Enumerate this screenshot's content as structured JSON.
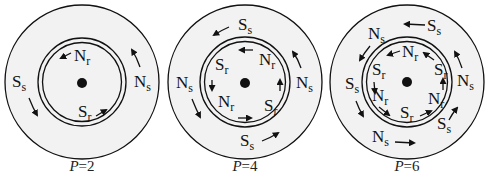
{
  "figure": {
    "background": "#ffffff",
    "ring_fill": "#f2f2f2",
    "stroke": "#111111",
    "diagrams": [
      {
        "id": "p2",
        "caption_var": "P",
        "caption_eq": "=2",
        "stator_labels": [
          {
            "main": "S",
            "sub": "s"
          },
          {
            "main": "N",
            "sub": "s"
          }
        ],
        "rotor_labels": [
          {
            "main": "N",
            "sub": "r"
          },
          {
            "main": "S",
            "sub": "r"
          }
        ]
      },
      {
        "id": "p4",
        "caption_var": "P",
        "caption_eq": "=4",
        "stator_labels": [
          {
            "main": "S",
            "sub": "s"
          },
          {
            "main": "N",
            "sub": "s"
          },
          {
            "main": "N",
            "sub": "s"
          },
          {
            "main": "S",
            "sub": "s"
          }
        ],
        "rotor_labels": [
          {
            "main": "N",
            "sub": "r"
          },
          {
            "main": "S",
            "sub": "r"
          },
          {
            "main": "S",
            "sub": "r"
          },
          {
            "main": "N",
            "sub": "r"
          }
        ]
      },
      {
        "id": "p6",
        "caption_var": "P",
        "caption_eq": "=6",
        "stator_labels": [
          {
            "main": "S",
            "sub": "s"
          },
          {
            "main": "N",
            "sub": "s"
          },
          {
            "main": "S",
            "sub": "s"
          },
          {
            "main": "N",
            "sub": "s"
          },
          {
            "main": "N",
            "sub": "s"
          },
          {
            "main": "S",
            "sub": "s"
          }
        ],
        "rotor_labels": [
          {
            "main": "N",
            "sub": "r"
          },
          {
            "main": "S",
            "sub": "r"
          },
          {
            "main": "S",
            "sub": "r"
          },
          {
            "main": "N",
            "sub": "r"
          },
          {
            "main": "N",
            "sub": "r"
          },
          {
            "main": "S",
            "sub": "r"
          }
        ]
      }
    ]
  }
}
